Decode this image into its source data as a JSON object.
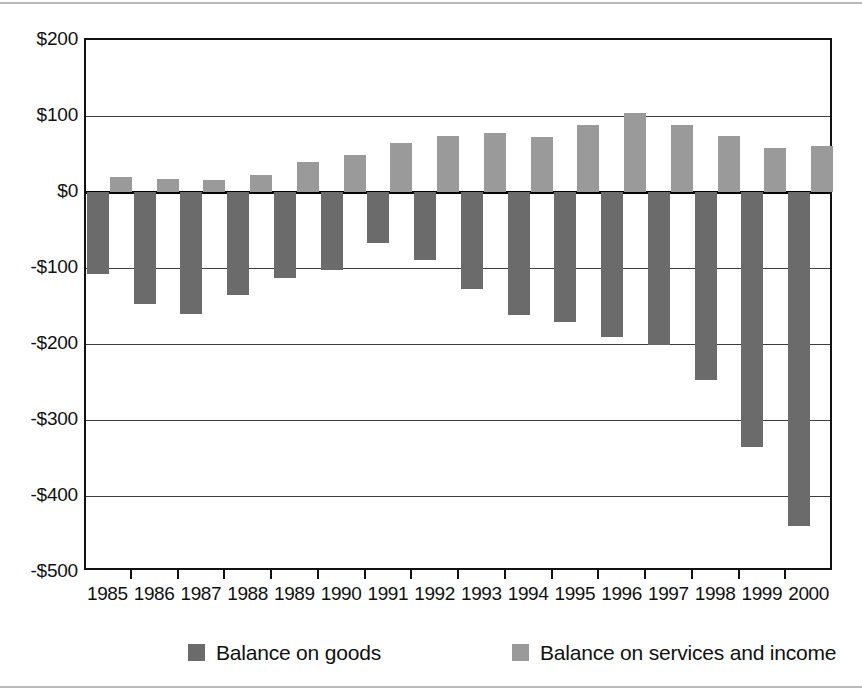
{
  "chart_data": {
    "type": "bar",
    "title": "",
    "subtitle": "",
    "xlabel": "",
    "ylabel": "",
    "grid": true,
    "legend_position": "bottom",
    "ylim": [
      -500,
      200
    ],
    "ytick_values": [
      200,
      100,
      0,
      -100,
      -200,
      -300,
      -400,
      -500
    ],
    "ytick_labels": [
      "$200",
      "$100",
      "$0",
      "-$100",
      "-$200",
      "-$300",
      "-$400",
      "-$500"
    ],
    "categories": [
      "1985",
      "1986",
      "1987",
      "1988",
      "1989",
      "1990",
      "1991",
      "1992",
      "1993",
      "1994",
      "1995",
      "1996",
      "1997",
      "1998",
      "1999",
      "2000"
    ],
    "series": [
      {
        "name": "Balance on goods",
        "color": "#6b6b6b",
        "values": [
          -108,
          -147,
          -160,
          -135,
          -113,
          -103,
          -67,
          -90,
          -128,
          -162,
          -171,
          -191,
          -201,
          -247,
          -335,
          -440
        ]
      },
      {
        "name": "Balance on services and income",
        "color": "#9a9a9a",
        "values": [
          20,
          17,
          16,
          23,
          40,
          49,
          64,
          74,
          77,
          73,
          88,
          104,
          88,
          74,
          58,
          61
        ]
      }
    ]
  },
  "legend": {
    "items": [
      {
        "label": "Balance on goods",
        "color": "#6b6b6b"
      },
      {
        "label": "Balance on services and income",
        "color": "#9a9a9a"
      }
    ]
  },
  "axis": {
    "y_labels": [
      "$200",
      "$100",
      "$0",
      "-$100",
      "-$200",
      "-$300",
      "-$400",
      "-$500"
    ],
    "x_labels": [
      "1985",
      "1986",
      "1987",
      "1988",
      "1989",
      "1990",
      "1991",
      "1992",
      "1993",
      "1994",
      "1995",
      "1996",
      "1997",
      "1998",
      "1999",
      "2000"
    ]
  }
}
